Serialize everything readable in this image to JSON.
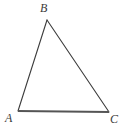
{
  "figure": {
    "kind": "geometry-diagram",
    "shape": "triangle",
    "background_color": "#ffffff",
    "canvas": {
      "width": 127,
      "height": 131
    },
    "stroke": {
      "side_color": "#3c3c3c",
      "side_width": 1.1,
      "base_color": "#555555",
      "base_width": 2.0
    },
    "vertices": [
      {
        "name": "A",
        "label": "A",
        "x": 18,
        "y": 111,
        "label_x": 5,
        "label_y": 112
      },
      {
        "name": "B",
        "label": "B",
        "x": 47,
        "y": 20,
        "label_x": 40,
        "label_y": 2
      },
      {
        "name": "C",
        "label": "C",
        "x": 109,
        "y": 112,
        "label_x": 110,
        "label_y": 113
      }
    ],
    "edges": [
      {
        "name": "AB",
        "from": "A",
        "to": "B",
        "style": "thin"
      },
      {
        "name": "BC",
        "from": "B",
        "to": "C",
        "style": "thin"
      },
      {
        "name": "AC",
        "from": "A",
        "to": "C",
        "style": "thick-base"
      }
    ],
    "label_color": "#3a3a3a",
    "label_font_size": "12px",
    "label_font_style": "italic"
  }
}
